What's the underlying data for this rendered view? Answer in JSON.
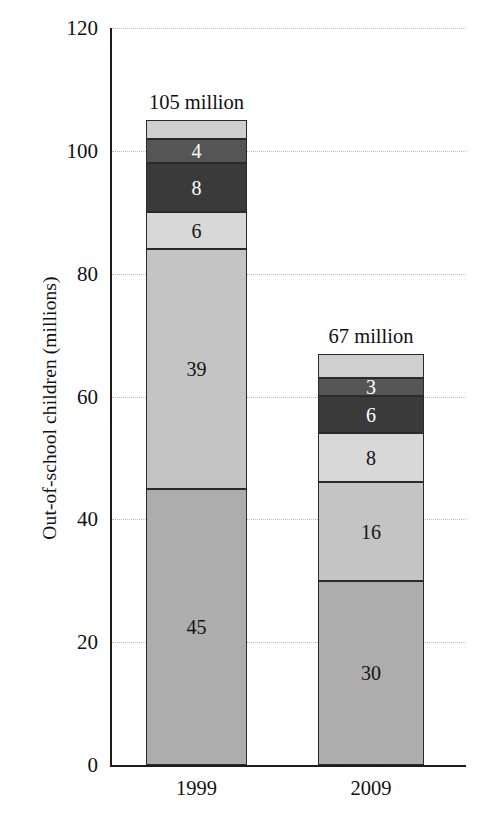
{
  "chart_data": {
    "type": "bar",
    "subtype": "stacked-bar",
    "title": "",
    "xlabel": "",
    "ylabel": "Out-of-school children (millions)",
    "categories": [
      "1999",
      "2009"
    ],
    "ylim": [
      0,
      120
    ],
    "yticks": [
      0,
      20,
      40,
      60,
      80,
      100,
      120
    ],
    "ytick_labels": [
      "0",
      "20",
      "40",
      "60",
      "80",
      "100",
      "120"
    ],
    "grid": true,
    "grid_axis": "y",
    "legend": "none",
    "stack_order": "bottom-to-top",
    "series": [
      {
        "name": "segment-1",
        "color": "#adadad",
        "values": [
          45,
          30
        ],
        "labels": [
          "45",
          "30"
        ]
      },
      {
        "name": "segment-2",
        "color": "#c4c4c4",
        "values": [
          39,
          16
        ],
        "labels": [
          "39",
          "16"
        ]
      },
      {
        "name": "segment-3",
        "color": "#d8d8d8",
        "values": [
          6,
          8
        ],
        "labels": [
          "6",
          "8"
        ]
      },
      {
        "name": "segment-4",
        "color": "#3a3a3a",
        "values": [
          8,
          6
        ],
        "labels": [
          "8",
          "6"
        ]
      },
      {
        "name": "segment-5",
        "color": "#555555",
        "values": [
          4,
          3
        ],
        "labels": [
          "4",
          "3"
        ]
      },
      {
        "name": "segment-6",
        "color": "#cfcfcf",
        "values": [
          3,
          4
        ],
        "labels": [
          "",
          ""
        ]
      }
    ],
    "totals": [
      105,
      67
    ],
    "total_annotations": [
      "105 million",
      "67 million"
    ],
    "annotations": [
      {
        "text": "105 million",
        "category": "1999",
        "position": "above-bar"
      },
      {
        "text": "67 million",
        "category": "2009",
        "position": "above-bar"
      }
    ]
  },
  "axis": {
    "y_title": "Out-of-school children (millions)",
    "y_ticks": [
      "120",
      "100",
      "80",
      "60",
      "40",
      "20",
      "0"
    ],
    "x_ticks": [
      "1999",
      "2009"
    ]
  },
  "bars": [
    {
      "category": "1999",
      "total_label": "105 million",
      "segments": [
        {
          "name": "top-light",
          "label": "",
          "value": 3,
          "color": "#cfcfcf",
          "label_color": "dark"
        },
        {
          "name": "mid-dark",
          "label": "4",
          "value": 4,
          "color": "#555555",
          "label_color": "light"
        },
        {
          "name": "darkest",
          "label": "8",
          "value": 8,
          "color": "#3a3a3a",
          "label_color": "light"
        },
        {
          "name": "pale",
          "label": "6",
          "value": 6,
          "color": "#d8d8d8",
          "label_color": "dark"
        },
        {
          "name": "light-gray",
          "label": "39",
          "value": 39,
          "color": "#c4c4c4",
          "label_color": "dark"
        },
        {
          "name": "mid-gray",
          "label": "45",
          "value": 45,
          "color": "#adadad",
          "label_color": "dark"
        }
      ]
    },
    {
      "category": "2009",
      "total_label": "67 million",
      "segments": [
        {
          "name": "top-light",
          "label": "",
          "value": 4,
          "color": "#cfcfcf",
          "label_color": "dark"
        },
        {
          "name": "mid-dark",
          "label": "3",
          "value": 3,
          "color": "#555555",
          "label_color": "light"
        },
        {
          "name": "darkest",
          "label": "6",
          "value": 6,
          "color": "#3a3a3a",
          "label_color": "light"
        },
        {
          "name": "pale",
          "label": "8",
          "value": 8,
          "color": "#d8d8d8",
          "label_color": "dark"
        },
        {
          "name": "light-gray",
          "label": "16",
          "value": 16,
          "color": "#c4c4c4",
          "label_color": "dark"
        },
        {
          "name": "mid-gray",
          "label": "30",
          "value": 30,
          "color": "#adadad",
          "label_color": "dark"
        }
      ]
    }
  ],
  "colors": {
    "axis": "#1c1c1c",
    "grid": "#b9b9b9",
    "text": "#111111",
    "background": "#ffffff"
  }
}
